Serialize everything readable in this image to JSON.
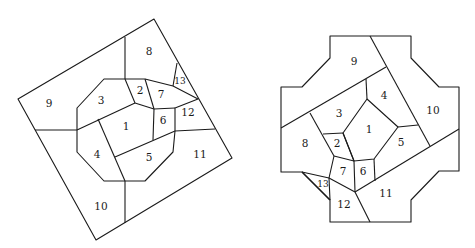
{
  "figures": [
    {
      "id": "left",
      "description": "Rotated square partitioned into 13 numbered regions around a central octagon",
      "outline": [
        [
          154,
          19
        ],
        [
          232,
          158
        ],
        [
          96,
          240
        ],
        [
          18,
          99
        ]
      ],
      "octagon": [
        [
          104,
          79
        ],
        [
          125,
          79
        ],
        [
          145,
          79
        ],
        [
          173,
          86
        ],
        [
          198,
          99
        ],
        [
          175,
          108
        ],
        [
          175,
          131
        ],
        [
          173,
          152
        ],
        [
          145,
          181
        ],
        [
          125,
          181
        ],
        [
          104,
          181
        ],
        [
          77,
          152
        ],
        [
          77,
          130
        ],
        [
          77,
          108
        ]
      ],
      "edges": [
        [
          [
            125,
            37
          ],
          [
            125,
            79
          ]
        ],
        [
          [
            35,
            130
          ],
          [
            77,
            130
          ]
        ],
        [
          [
            77,
            130
          ],
          [
            135,
            103
          ]
        ],
        [
          [
            125,
            79
          ],
          [
            135,
            103
          ]
        ],
        [
          [
            135,
            103
          ],
          [
            154,
            109
          ]
        ],
        [
          [
            145,
            79
          ],
          [
            154,
            109
          ]
        ],
        [
          [
            154,
            109
          ],
          [
            175,
            108
          ]
        ],
        [
          [
            154,
            109
          ],
          [
            153,
            140
          ]
        ],
        [
          [
            98,
            119
          ],
          [
            125,
            181
          ]
        ],
        [
          [
            115,
            157
          ],
          [
            175,
            131
          ]
        ],
        [
          [
            175,
            131
          ],
          [
            215,
            129
          ]
        ],
        [
          [
            177,
            63
          ],
          [
            173,
            86
          ]
        ],
        [
          [
            125,
            181
          ],
          [
            125,
            223
          ]
        ]
      ],
      "labels": [
        {
          "text": "1",
          "x": 126,
          "y": 127
        },
        {
          "text": "2",
          "x": 140,
          "y": 91
        },
        {
          "text": "3",
          "x": 101,
          "y": 101
        },
        {
          "text": "4",
          "x": 97,
          "y": 155
        },
        {
          "text": "5",
          "x": 149,
          "y": 158
        },
        {
          "text": "6",
          "x": 163,
          "y": 121
        },
        {
          "text": "7",
          "x": 161,
          "y": 95
        },
        {
          "text": "8",
          "x": 149,
          "y": 52
        },
        {
          "text": "9",
          "x": 49,
          "y": 104
        },
        {
          "text": "10",
          "x": 101,
          "y": 207
        },
        {
          "text": "11",
          "x": 200,
          "y": 155
        },
        {
          "text": "12",
          "x": 188,
          "y": 113
        },
        {
          "text": "13",
          "x": 180,
          "y": 81,
          "small": true
        }
      ]
    },
    {
      "id": "right",
      "description": "Cross-shaped octagonal region partitioned into 13 numbered regions",
      "outline": [
        [
          330,
          36
        ],
        [
          411,
          36
        ],
        [
          411,
          58
        ],
        [
          439,
          87
        ],
        [
          459,
          87
        ],
        [
          459,
          171
        ],
        [
          439,
          171
        ],
        [
          411,
          200
        ],
        [
          411,
          222
        ],
        [
          330,
          222
        ],
        [
          330,
          200
        ],
        [
          302,
          172
        ],
        [
          281,
          172
        ],
        [
          281,
          87
        ],
        [
          302,
          87
        ],
        [
          330,
          58
        ]
      ],
      "edges": [
        [
          [
            370,
            36
          ],
          [
            430,
            146
          ]
        ],
        [
          [
            281,
            128
          ],
          [
            386,
            67
          ]
        ],
        [
          [
            366,
            79
          ],
          [
            367,
            99
          ]
        ],
        [
          [
            367,
            99
          ],
          [
            398,
            127
          ],
          [
            374,
            159
          ],
          [
            354,
            161
          ],
          [
            343,
            133
          ],
          [
            367,
            99
          ]
        ],
        [
          [
            398,
            127
          ],
          [
            418,
            125
          ]
        ],
        [
          [
            310,
            113
          ],
          [
            334,
            156
          ]
        ],
        [
          [
            323,
            134
          ],
          [
            343,
            133
          ]
        ],
        [
          [
            343,
            133
          ],
          [
            354,
            161
          ]
        ],
        [
          [
            334,
            156
          ],
          [
            354,
            161
          ]
        ],
        [
          [
            374,
            159
          ],
          [
            375,
            181
          ]
        ],
        [
          [
            354,
            161
          ],
          [
            355,
            192
          ]
        ],
        [
          [
            334,
            156
          ],
          [
            329,
            178
          ],
          [
            330,
            200
          ]
        ],
        [
          [
            302,
            172
          ],
          [
            329,
            178
          ],
          [
            355,
            192
          ]
        ],
        [
          [
            302,
            172
          ],
          [
            330,
            200
          ]
        ],
        [
          [
            355,
            192
          ],
          [
            459,
            129
          ]
        ],
        [
          [
            355,
            192
          ],
          [
            370,
            222
          ]
        ]
      ],
      "labels": [
        {
          "text": "1",
          "x": 369,
          "y": 130
        },
        {
          "text": "2",
          "x": 337,
          "y": 144
        },
        {
          "text": "3",
          "x": 339,
          "y": 114
        },
        {
          "text": "4",
          "x": 384,
          "y": 96
        },
        {
          "text": "5",
          "x": 401,
          "y": 143
        },
        {
          "text": "6",
          "x": 363,
          "y": 172
        },
        {
          "text": "7",
          "x": 343,
          "y": 172
        },
        {
          "text": "8",
          "x": 305,
          "y": 144
        },
        {
          "text": "9",
          "x": 354,
          "y": 62
        },
        {
          "text": "10",
          "x": 433,
          "y": 111
        },
        {
          "text": "11",
          "x": 386,
          "y": 194
        },
        {
          "text": "12",
          "x": 344,
          "y": 205
        },
        {
          "text": "13",
          "x": 323,
          "y": 184,
          "small": true
        }
      ]
    }
  ]
}
